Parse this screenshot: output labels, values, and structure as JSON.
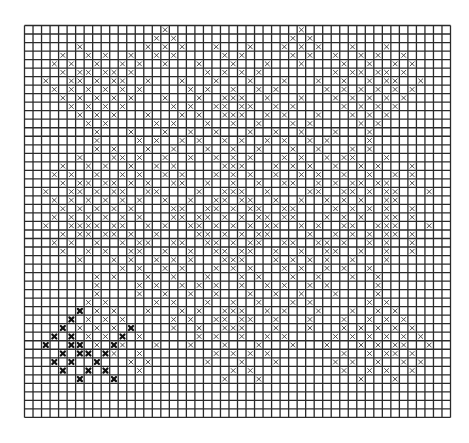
{
  "diagram": {
    "caption": "Grid chart with x-marked cells",
    "grid": {
      "columns": 50,
      "rows": 46,
      "origin_x": 24.5,
      "origin_y": 25.5,
      "cell_size": 8.52,
      "line_color": "#2b2b2b",
      "background": "#ffffff"
    },
    "marks": {
      "light_color": "#3a3a3a",
      "dark_color": "#111111",
      "light_symbol": "x",
      "dark_symbol": "x-bold"
    },
    "rows": {
      "0": [
        16,
        32
      ],
      "1": [
        15,
        17,
        31,
        33
      ],
      "2": [
        6,
        14,
        16,
        18,
        22,
        26,
        30,
        32,
        34,
        38,
        42
      ],
      "3": [
        4,
        7,
        9,
        12,
        15,
        17,
        23,
        25,
        31,
        33,
        36,
        39,
        41,
        44
      ],
      "4": [
        3,
        5,
        8,
        11,
        13,
        16,
        20,
        24,
        28,
        32,
        37,
        40,
        43,
        45
      ],
      "5": [
        4,
        6,
        7,
        9,
        10,
        12,
        21,
        23,
        25,
        27,
        36,
        38,
        39,
        41,
        42,
        44
      ],
      "6": [
        2,
        5,
        6,
        8,
        10,
        11,
        14,
        18,
        22,
        26,
        30,
        34,
        37,
        40,
        42,
        43,
        46
      ],
      "7": [
        3,
        5,
        7,
        9,
        11,
        13,
        19,
        21,
        24,
        27,
        29,
        35,
        37,
        39,
        41,
        43,
        45
      ],
      "8": [
        4,
        6,
        8,
        10,
        12,
        16,
        20,
        23,
        24,
        25,
        28,
        32,
        36,
        38,
        40,
        42,
        44
      ],
      "9": [
        5,
        7,
        9,
        11,
        17,
        19,
        22,
        23,
        25,
        26,
        29,
        31,
        37,
        39,
        41,
        43
      ],
      "10": [
        6,
        8,
        10,
        14,
        18,
        20,
        23,
        24,
        25,
        28,
        30,
        34,
        38,
        40,
        42
      ],
      "11": [
        7,
        9,
        15,
        17,
        21,
        24,
        27,
        31,
        33,
        39,
        41
      ],
      "12": [
        8,
        12,
        16,
        19,
        22,
        26,
        29,
        32,
        36,
        40
      ],
      "13": [
        8,
        13,
        15,
        18,
        20,
        23,
        25,
        28,
        30,
        33,
        35,
        40
      ],
      "14": [
        8,
        10,
        14,
        17,
        21,
        24,
        27,
        31,
        34,
        38,
        40
      ],
      "15": [
        6,
        10,
        11,
        13,
        16,
        19,
        22,
        24,
        26,
        30,
        32,
        35,
        37,
        38,
        42
      ],
      "16": [
        4,
        7,
        9,
        12,
        15,
        17,
        23,
        24,
        25,
        29,
        31,
        33,
        36,
        39,
        41,
        45
      ],
      "17": [
        3,
        5,
        8,
        11,
        13,
        16,
        18,
        22,
        24,
        26,
        29,
        32,
        34,
        37,
        40,
        43,
        45
      ],
      "18": [
        4,
        6,
        7,
        9,
        10,
        12,
        14,
        17,
        18,
        21,
        24,
        27,
        30,
        31,
        34,
        36,
        38,
        39,
        41,
        42,
        45
      ],
      "19": [
        2,
        5,
        6,
        8,
        10,
        11,
        14,
        15,
        20,
        23,
        24,
        25,
        28,
        33,
        34,
        37,
        38,
        40,
        42,
        43,
        47
      ],
      "20": [
        3,
        5,
        7,
        9,
        11,
        13,
        16,
        19,
        22,
        23,
        25,
        26,
        29,
        32,
        35,
        37,
        39,
        42,
        43
      ],
      "21": [
        4,
        6,
        8,
        10,
        12,
        17,
        18,
        21,
        22,
        24,
        26,
        27,
        30,
        31,
        36,
        38,
        40,
        42,
        45
      ],
      "22": [
        3,
        5,
        7,
        9,
        11,
        13,
        17,
        18,
        20,
        21,
        23,
        25,
        27,
        28,
        30,
        31,
        35,
        37,
        39,
        42,
        43,
        45
      ],
      "23": [
        2,
        5,
        6,
        7,
        8,
        10,
        11,
        14,
        16,
        19,
        20,
        22,
        24,
        26,
        28,
        29,
        32,
        34,
        37,
        38,
        41,
        42,
        43,
        47
      ],
      "24": [
        4,
        6,
        7,
        9,
        10,
        12,
        15,
        20,
        21,
        23,
        25,
        27,
        28,
        33,
        36,
        38,
        40,
        42,
        43,
        45
      ],
      "25": [
        3,
        5,
        8,
        11,
        13,
        14,
        17,
        18,
        21,
        22,
        24,
        26,
        27,
        30,
        31,
        34,
        35,
        37,
        40,
        42,
        45
      ],
      "26": [
        4,
        7,
        9,
        12,
        13,
        16,
        19,
        22,
        23,
        25,
        26,
        29,
        32,
        35,
        36,
        39,
        42,
        45
      ],
      "27": [
        6,
        10,
        12,
        15,
        17,
        19,
        23,
        24,
        25,
        29,
        31,
        33,
        35,
        38,
        42
      ],
      "28": [
        11,
        13,
        16,
        18,
        22,
        24,
        26,
        30,
        32,
        35,
        37,
        40
      ],
      "29": [
        8,
        10,
        14,
        17,
        21,
        25,
        27,
        31,
        34,
        38,
        41
      ],
      "30": [
        8,
        13,
        15,
        18,
        20,
        22,
        25,
        28,
        30,
        33,
        35,
        41
      ],
      "31": [
        8,
        13,
        16,
        19,
        22,
        26,
        29,
        32,
        36,
        41
      ],
      "32": [
        7,
        9,
        15,
        17,
        21,
        24,
        27,
        31,
        33,
        40,
        42
      ],
      "33": [
        8,
        10,
        14,
        18,
        20,
        23,
        24,
        25,
        28,
        30,
        34,
        38,
        41,
        43
      ],
      "34": [
        7,
        9,
        11,
        17,
        19,
        22,
        23,
        25,
        26,
        29,
        33,
        37,
        40,
        42,
        44
      ],
      "35": [
        6,
        8,
        10,
        17,
        20,
        23,
        24,
        25,
        29,
        33,
        37,
        39,
        41,
        43,
        45
      ],
      "36": [
        7,
        9,
        13,
        20,
        22,
        25,
        28,
        30,
        36,
        38,
        40,
        42,
        44,
        46
      ],
      "37": [
        8,
        11,
        15,
        19,
        23,
        27,
        31,
        35,
        39,
        41,
        43,
        44,
        47
      ],
      "38": [
        10,
        13,
        22,
        24,
        26,
        28,
        37,
        40,
        42,
        43,
        45
      ],
      "39": [
        12,
        14,
        21,
        25,
        29,
        36,
        38,
        41,
        44,
        46
      ],
      "40": [
        13,
        24,
        26,
        37,
        40,
        42,
        45
      ],
      "41": [
        23,
        27,
        39,
        43
      ]
    },
    "dark_rows": {
      "33": [
        6
      ],
      "34": [
        5
      ],
      "35": [
        4,
        12
      ],
      "36": [
        3,
        5,
        11
      ],
      "37": [
        2,
        5,
        6,
        10
      ],
      "38": [
        4,
        6,
        7,
        9
      ],
      "39": [
        3,
        5,
        8
      ],
      "40": [
        4,
        7,
        9
      ],
      "41": [
        6,
        10
      ]
    }
  }
}
